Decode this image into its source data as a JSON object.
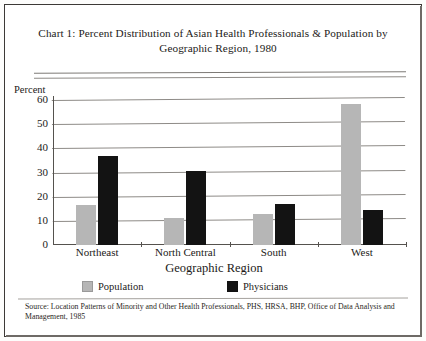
{
  "chart_data": {
    "type": "bar",
    "title": "Chart 1:  Percent Distribution of Asian Health Professionals & Population by Geographic Region, 1980",
    "title_line1": "Chart 1:  Percent Distribution of Asian Health Professionals & Population by",
    "title_line2": "Geographic Region, 1980",
    "xlabel": "Geographic Region",
    "ylabel": "Percent",
    "categories": [
      "Northeast",
      "North Central",
      "South",
      "West"
    ],
    "series": [
      {
        "name": "Population",
        "color": "#b6b6b6",
        "values": [
          16.5,
          11,
          13,
          58.5
        ]
      },
      {
        "name": "Physicians",
        "color": "#131313",
        "values": [
          37,
          30.5,
          17,
          14.5
        ]
      }
    ],
    "yticks": [
      60,
      50,
      40,
      30,
      20,
      10,
      0
    ],
    "ylim": [
      0,
      60
    ],
    "grid": true,
    "legend_position": "bottom",
    "source": "Source:  Location Patterns of Minority and Other Health Professionals, PHS, HRSA, BHP, Office of Data Analysis and Management, 1985"
  }
}
